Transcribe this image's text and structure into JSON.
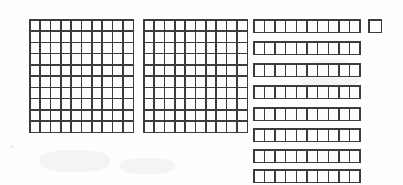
{
  "image": {
    "title": "Base-ten blocks place value model",
    "width": 403,
    "height": 185,
    "background_color": "#fefefe",
    "stroke_color": "#3c3c3c",
    "cell_fill_color": "#fdfdfd"
  },
  "model": {
    "kind": "base-ten-blocks",
    "represented_number": 281,
    "groups": [
      {
        "name": "hundreds",
        "block_label": "hundred-flat",
        "count": 2,
        "unit_value": 100,
        "group_value": 200,
        "rows": 10,
        "columns": 10,
        "cells_per_block": 100
      },
      {
        "name": "tens",
        "block_label": "ten-rod",
        "count": 8,
        "unit_value": 10,
        "group_value": 80,
        "rows": 1,
        "columns": 10,
        "cells_per_block": 10
      },
      {
        "name": "ones",
        "block_label": "unit-cube",
        "count": 1,
        "unit_value": 1,
        "group_value": 1,
        "rows": 1,
        "columns": 1,
        "cells_per_block": 1
      }
    ]
  },
  "layout": {
    "flats": [
      {
        "id": "flat-1",
        "x": 29,
        "y": 19,
        "w": 105,
        "h": 114
      },
      {
        "id": "flat-2",
        "x": 143,
        "y": 19,
        "w": 105,
        "h": 114
      }
    ],
    "rods": [
      {
        "id": "rod-1",
        "x": 253,
        "y": 19,
        "w": 108,
        "h": 14
      },
      {
        "id": "rod-2",
        "x": 253,
        "y": 41,
        "w": 108,
        "h": 14
      },
      {
        "id": "rod-3",
        "x": 253,
        "y": 63,
        "w": 108,
        "h": 14
      },
      {
        "id": "rod-4",
        "x": 253,
        "y": 85,
        "w": 108,
        "h": 14
      },
      {
        "id": "rod-5",
        "x": 253,
        "y": 107,
        "w": 108,
        "h": 14
      },
      {
        "id": "rod-6",
        "x": 253,
        "y": 128,
        "w": 108,
        "h": 14
      },
      {
        "id": "rod-7",
        "x": 253,
        "y": 149,
        "w": 108,
        "h": 14
      },
      {
        "id": "rod-8",
        "x": 253,
        "y": 169,
        "w": 108,
        "h": 14
      }
    ],
    "units": [
      {
        "id": "unit-1",
        "x": 368,
        "y": 19,
        "w": 14,
        "h": 14
      }
    ],
    "speckles": [
      {
        "x": 32,
        "y": 24,
        "w": 3,
        "h": 2
      },
      {
        "x": 10,
        "y": 145,
        "w": 3,
        "h": 3
      },
      {
        "x": 196,
        "y": 42,
        "w": 2,
        "h": 2
      },
      {
        "x": 199,
        "y": 97,
        "w": 3,
        "h": 2
      },
      {
        "x": 327,
        "y": 112,
        "w": 2,
        "h": 2
      }
    ],
    "smudges": [
      {
        "x": 40,
        "y": 150,
        "w": 70,
        "h": 22
      },
      {
        "x": 120,
        "y": 158,
        "w": 55,
        "h": 16
      },
      {
        "x": 300,
        "y": 60,
        "w": 60,
        "h": 30
      }
    ]
  }
}
